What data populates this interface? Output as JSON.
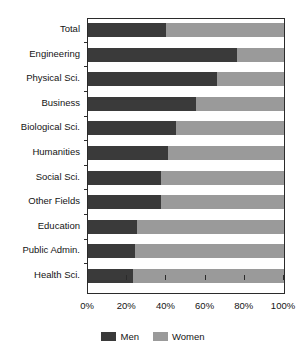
{
  "chart_data": {
    "type": "bar",
    "orientation": "horizontal",
    "stacked": true,
    "normalized": true,
    "title": "",
    "subtitle": "",
    "xlabel": "",
    "ylabel": "",
    "xlim": [
      0,
      100
    ],
    "xticks": [
      0,
      20,
      40,
      60,
      80,
      100
    ],
    "xticklabels": [
      "0%",
      "20%",
      "40%",
      "60%",
      "80%",
      "100%"
    ],
    "grid": false,
    "legend_position": "bottom",
    "categories": [
      "Total",
      "Engineering",
      "Physical Sci.",
      "Business",
      "Biological Sci.",
      "Humanities",
      "Social Sci.",
      "Other Fields",
      "Education",
      "Public Admin.",
      "Health Sci."
    ],
    "series": [
      {
        "name": "Men",
        "color": "#3a3a3a",
        "values": [
          40,
          76,
          66,
          55,
          45,
          41,
          37,
          37,
          25,
          24,
          23
        ]
      },
      {
        "name": "Women",
        "color": "#9a9a9a",
        "values": [
          60,
          24,
          34,
          45,
          55,
          59,
          63,
          63,
          75,
          76,
          77
        ]
      }
    ]
  },
  "axis": {
    "frame_color": "#2b2b2b",
    "tick_color": "#2b2b2b",
    "label_color": "#141414"
  }
}
